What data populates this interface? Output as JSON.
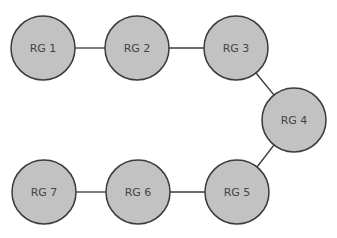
{
  "diagram": {
    "type": "chain-graph",
    "nodes": [
      {
        "id": "rg1",
        "label": "RG 1",
        "cx": 43,
        "cy": 48
      },
      {
        "id": "rg2",
        "label": "RG 2",
        "cx": 137,
        "cy": 48
      },
      {
        "id": "rg3",
        "label": "RG 3",
        "cx": 236,
        "cy": 48
      },
      {
        "id": "rg4",
        "label": "RG 4",
        "cx": 294,
        "cy": 120
      },
      {
        "id": "rg5",
        "label": "RG 5",
        "cx": 237,
        "cy": 192
      },
      {
        "id": "rg6",
        "label": "RG 6",
        "cx": 138,
        "cy": 192
      },
      {
        "id": "rg7",
        "label": "RG 7",
        "cx": 44,
        "cy": 192
      }
    ],
    "edges": [
      [
        "rg1",
        "rg2"
      ],
      [
        "rg2",
        "rg3"
      ],
      [
        "rg3",
        "rg4"
      ],
      [
        "rg4",
        "rg5"
      ],
      [
        "rg5",
        "rg6"
      ],
      [
        "rg6",
        "rg7"
      ]
    ],
    "colors": {
      "node_fill": "#c2c2c2",
      "stroke": "#3a3a3a",
      "text": "#444444"
    }
  }
}
